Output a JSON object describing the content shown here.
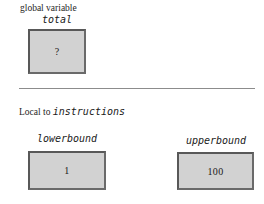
{
  "global_scope": {
    "label": "global variable",
    "variable": {
      "name": "total",
      "value": "?"
    }
  },
  "local_scope": {
    "label_prefix": "Local to",
    "label_function": "instructions",
    "variables": [
      {
        "name": "lowerbound",
        "value": "1"
      },
      {
        "name": "upperbound",
        "value": "100"
      }
    ]
  },
  "style": {
    "page_background": "#ffffff",
    "box_fill": "#d2d2d2",
    "box_border": "#585858",
    "divider_color": "#8c8c8c",
    "text_color": "#1a1a1a"
  }
}
